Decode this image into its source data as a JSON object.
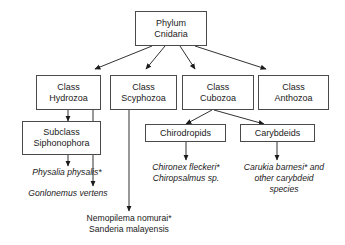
{
  "diagram": {
    "type": "taxonomic-flowchart",
    "colors": {
      "background": "#ffffff",
      "box_border": "#4a4a4a",
      "connector": "#1a1a1a",
      "text": "#1a1a1a"
    },
    "nodes": [
      {
        "id": "phylum",
        "lines": [
          "Phylum",
          "Cnidaria"
        ],
        "level": "phylum"
      },
      {
        "id": "class-hydrozoa",
        "lines": [
          "Class",
          "Hydrozoa"
        ],
        "level": "class"
      },
      {
        "id": "class-scyphozoa",
        "lines": [
          "Class",
          "Scyphozoa"
        ],
        "level": "class"
      },
      {
        "id": "class-cubozoa",
        "lines": [
          "Class",
          "Cubozoa"
        ],
        "level": "class"
      },
      {
        "id": "class-anthozoa",
        "lines": [
          "Class",
          "Anthozoa"
        ],
        "level": "class"
      },
      {
        "id": "subclass-siphonophora",
        "lines": [
          "Subclass",
          "Siphonophora"
        ],
        "level": "subclass"
      },
      {
        "id": "chirodropids",
        "lines": [
          "Chirodropids"
        ],
        "level": "order"
      },
      {
        "id": "carybdeids",
        "lines": [
          "Carybdeids"
        ],
        "level": "order"
      }
    ],
    "leaves": [
      {
        "id": "physalia",
        "lines": [
          "Physalia physalis*"
        ],
        "italic": true
      },
      {
        "id": "gonlonemus",
        "lines": [
          "Gonlonemus vertens"
        ],
        "italic": true
      },
      {
        "id": "nemopilema",
        "lines": [
          "Nemopilema nomurai*",
          "Sanderia malayensis"
        ],
        "italic": false
      },
      {
        "id": "chironex",
        "lines": [
          "Chironex fleckeri*",
          "Chiropsalmus sp."
        ],
        "italic": true
      },
      {
        "id": "carukia",
        "lines": [
          "Carukia barnesi* and",
          "other carybdeid",
          "species"
        ],
        "italic": true
      }
    ],
    "edges": [
      {
        "from": "phylum",
        "to": "class-hydrozoa"
      },
      {
        "from": "phylum",
        "to": "class-scyphozoa"
      },
      {
        "from": "phylum",
        "to": "class-cubozoa"
      },
      {
        "from": "phylum",
        "to": "class-anthozoa"
      },
      {
        "from": "class-hydrozoa",
        "to": "subclass-siphonophora"
      },
      {
        "from": "subclass-siphonophora",
        "to": "physalia"
      },
      {
        "from": "class-hydrozoa",
        "to": "gonlonemus"
      },
      {
        "from": "class-scyphozoa",
        "to": "nemopilema"
      },
      {
        "from": "class-cubozoa",
        "to": "chirodropids"
      },
      {
        "from": "class-cubozoa",
        "to": "carybdeids"
      },
      {
        "from": "chirodropids",
        "to": "chironex"
      },
      {
        "from": "carybdeids",
        "to": "carukia"
      }
    ]
  }
}
